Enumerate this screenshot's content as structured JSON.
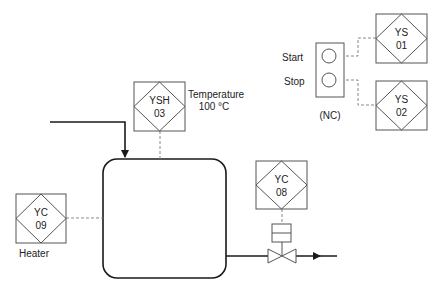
{
  "diagram": {
    "type": "process-instrumentation",
    "colors": {
      "line": "#1a1a1a",
      "instrument": "#555555",
      "signal": "#888888",
      "background": "#ffffff"
    },
    "instruments": [
      {
        "id": "ys01",
        "tag": "YS",
        "number": "01"
      },
      {
        "id": "ys02",
        "tag": "YS",
        "number": "02"
      },
      {
        "id": "ysh03",
        "tag": "YSH",
        "number": "03"
      },
      {
        "id": "yc08",
        "tag": "YC",
        "number": "08"
      },
      {
        "id": "yc09",
        "tag": "YC",
        "number": "09"
      }
    ],
    "labels": {
      "start": "Start",
      "stop": "Stop",
      "nc": "(NC)",
      "temperature": "Temperature",
      "temperature_value": "100 °C",
      "heater": "Heater"
    }
  }
}
